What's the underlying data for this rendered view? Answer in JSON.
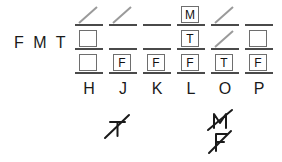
{
  "diagram": {
    "row_label": "F M T",
    "columns": [
      {
        "label": "H"
      },
      {
        "label": "J"
      },
      {
        "label": "K"
      },
      {
        "label": "L"
      },
      {
        "label": "O"
      },
      {
        "label": "P"
      }
    ],
    "rows": [
      {
        "row_letter": "F",
        "cells": [
          {
            "type": "slash",
            "text": ""
          },
          {
            "type": "slash",
            "text": ""
          },
          {
            "type": "blank",
            "text": ""
          },
          {
            "type": "box",
            "text": "M"
          },
          {
            "type": "slash",
            "text": ""
          },
          {
            "type": "blank",
            "text": ""
          }
        ]
      },
      {
        "row_letter": "M",
        "cells": [
          {
            "type": "box",
            "text": ""
          },
          {
            "type": "blank",
            "text": ""
          },
          {
            "type": "blank",
            "text": ""
          },
          {
            "type": "box",
            "text": "T"
          },
          {
            "type": "slash",
            "text": ""
          },
          {
            "type": "box",
            "text": ""
          }
        ]
      },
      {
        "row_letter": "T",
        "cells": [
          {
            "type": "box",
            "text": ""
          },
          {
            "type": "box",
            "text": "F"
          },
          {
            "type": "box",
            "text": "F"
          },
          {
            "type": "box",
            "text": "F"
          },
          {
            "type": "box",
            "text": "T"
          },
          {
            "type": "box",
            "text": "F"
          }
        ]
      }
    ],
    "annotations": [
      {
        "column": "J",
        "marks": [
          "T"
        ],
        "style": "handwritten-struck"
      },
      {
        "column": "O",
        "marks": [
          "M",
          "F"
        ],
        "style": "handwritten-struck"
      }
    ],
    "colors": {
      "ink": "#1a1a1a",
      "rule": "#4a4a4a",
      "box_border": "#6e6e6e",
      "slash": "#9a9a9a",
      "background": "#ffffff"
    }
  }
}
